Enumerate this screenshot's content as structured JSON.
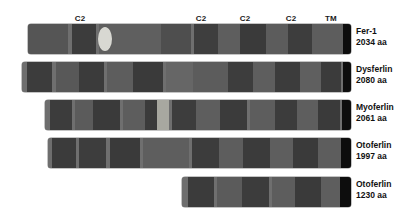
{
  "figure": {
    "type": "protein-domain-diagram",
    "caption_partial": "",
    "background": "#ffffff",
    "annotations": [
      {
        "text": "C2",
        "x": 80,
        "y": 14
      },
      {
        "text": "C2",
        "x": 201,
        "y": 14
      },
      {
        "text": "C2",
        "x": 245,
        "y": 14
      },
      {
        "text": "C2",
        "x": 291,
        "y": 14
      },
      {
        "text": "TM",
        "x": 331,
        "y": 14
      }
    ],
    "colors": {
      "bar_base": "#6f6f6f",
      "domain_dark": "#3f3f3f",
      "domain_mid": "#4e4e4e",
      "domain_light": "#5e5e5e",
      "spacer": "#6e6e6e",
      "spacer_light": "#7b7b7b",
      "tm_black": "#0d0d0d",
      "lens_light": "#d8d8d2",
      "highlight_light": "#a8a8a0",
      "text": "#111111"
    },
    "proteins": [
      {
        "name": "Fer-1",
        "length_label": "2034 aa",
        "row_top": 24,
        "bar_left": 28,
        "bar_right": 351,
        "label_x": 356,
        "label_y": 26,
        "lens": {
          "cx": 105,
          "rx": 7,
          "ry": 12
        },
        "segments": [
          {
            "x": 28,
            "w": 40,
            "color": "#555555"
          },
          {
            "x": 68,
            "w": 4,
            "color": "#6f6f6f"
          },
          {
            "x": 72,
            "w": 24,
            "color": "#3c3c3c"
          },
          {
            "x": 96,
            "w": 3,
            "color": "#6f6f6f"
          },
          {
            "x": 99,
            "w": 62,
            "color": "#5f5f5f"
          },
          {
            "x": 161,
            "w": 30,
            "color": "#4e4e4e"
          },
          {
            "x": 191,
            "w": 3,
            "color": "#6f6f6f"
          },
          {
            "x": 194,
            "w": 24,
            "color": "#3e3e3e"
          },
          {
            "x": 218,
            "w": 22,
            "color": "#5e5e5e"
          },
          {
            "x": 240,
            "w": 26,
            "color": "#3a3a3a"
          },
          {
            "x": 266,
            "w": 22,
            "color": "#5c5c5c"
          },
          {
            "x": 288,
            "w": 24,
            "color": "#3d3d3d"
          },
          {
            "x": 312,
            "w": 31,
            "color": "#5d5d5d"
          },
          {
            "x": 343,
            "w": 8,
            "color": "#0d0d0d"
          }
        ]
      },
      {
        "name": "Dysferlin",
        "length_label": "2080 aa",
        "row_top": 62,
        "bar_left": 22,
        "bar_right": 351,
        "label_x": 356,
        "label_y": 64,
        "lens": null,
        "segments": [
          {
            "x": 22,
            "w": 5,
            "color": "#6e6e6e"
          },
          {
            "x": 27,
            "w": 25,
            "color": "#3c3c3c"
          },
          {
            "x": 52,
            "w": 4,
            "color": "#6f6f6f"
          },
          {
            "x": 56,
            "w": 23,
            "color": "#585858"
          },
          {
            "x": 79,
            "w": 25,
            "color": "#3b3b3b"
          },
          {
            "x": 104,
            "w": 3,
            "color": "#6f6f6f"
          },
          {
            "x": 107,
            "w": 26,
            "color": "#5d5d5d"
          },
          {
            "x": 133,
            "w": 30,
            "color": "#3a3a3a"
          },
          {
            "x": 163,
            "w": 3,
            "color": "#6f6f6f"
          },
          {
            "x": 166,
            "w": 27,
            "color": "#666666"
          },
          {
            "x": 193,
            "w": 35,
            "color": "#5c5c5c"
          },
          {
            "x": 228,
            "w": 25,
            "color": "#3d3d3d"
          },
          {
            "x": 253,
            "w": 22,
            "color": "#5e5e5e"
          },
          {
            "x": 275,
            "w": 25,
            "color": "#3c3c3c"
          },
          {
            "x": 300,
            "w": 21,
            "color": "#5f5f5f"
          },
          {
            "x": 321,
            "w": 20,
            "color": "#3b3b3b"
          },
          {
            "x": 341,
            "w": 2,
            "color": "#6f6f6f"
          },
          {
            "x": 343,
            "w": 8,
            "color": "#0d0d0d"
          }
        ]
      },
      {
        "name": "Myoferlin",
        "length_label": "2061 aa",
        "row_top": 100,
        "bar_left": 45,
        "bar_right": 351,
        "label_x": 356,
        "label_y": 102,
        "lens": null,
        "segments": [
          {
            "x": 45,
            "w": 5,
            "color": "#6e6e6e"
          },
          {
            "x": 50,
            "w": 22,
            "color": "#3c3c3c"
          },
          {
            "x": 72,
            "w": 3,
            "color": "#6f6f6f"
          },
          {
            "x": 75,
            "w": 18,
            "color": "#5b5b5b"
          },
          {
            "x": 93,
            "w": 27,
            "color": "#3a3a3a"
          },
          {
            "x": 120,
            "w": 3,
            "color": "#6f6f6f"
          },
          {
            "x": 123,
            "w": 22,
            "color": "#5d5d5d"
          },
          {
            "x": 145,
            "w": 12,
            "color": "#3b3b3b"
          },
          {
            "x": 157,
            "w": 12,
            "color": "#a8a8a0"
          },
          {
            "x": 169,
            "w": 3,
            "color": "#6f6f6f"
          },
          {
            "x": 172,
            "w": 24,
            "color": "#3d3d3d"
          },
          {
            "x": 196,
            "w": 24,
            "color": "#5e5e5e"
          },
          {
            "x": 220,
            "w": 27,
            "color": "#3b3b3b"
          },
          {
            "x": 247,
            "w": 3,
            "color": "#6f6f6f"
          },
          {
            "x": 250,
            "w": 25,
            "color": "#5d5d5d"
          },
          {
            "x": 275,
            "w": 22,
            "color": "#3c3c3c"
          },
          {
            "x": 297,
            "w": 21,
            "color": "#5e5e5e"
          },
          {
            "x": 318,
            "w": 22,
            "color": "#3a3a3a"
          },
          {
            "x": 340,
            "w": 2,
            "color": "#6f6f6f"
          },
          {
            "x": 342,
            "w": 9,
            "color": "#0d0d0d"
          }
        ]
      },
      {
        "name": "Otoferlin",
        "length_label": "1997 aa",
        "row_top": 138,
        "bar_left": 48,
        "bar_right": 351,
        "label_x": 356,
        "label_y": 140,
        "lens": null,
        "segments": [
          {
            "x": 48,
            "w": 4,
            "color": "#6e6e6e"
          },
          {
            "x": 52,
            "w": 24,
            "color": "#3b3b3b"
          },
          {
            "x": 76,
            "w": 3,
            "color": "#6f6f6f"
          },
          {
            "x": 79,
            "w": 27,
            "color": "#3d3d3d"
          },
          {
            "x": 106,
            "w": 4,
            "color": "#6f6f6f"
          },
          {
            "x": 110,
            "w": 30,
            "color": "#3a3a3a"
          },
          {
            "x": 140,
            "w": 3,
            "color": "#6f6f6f"
          },
          {
            "x": 143,
            "w": 46,
            "color": "#5e5e5e"
          },
          {
            "x": 189,
            "w": 3,
            "color": "#6f6f6f"
          },
          {
            "x": 192,
            "w": 27,
            "color": "#3c3c3c"
          },
          {
            "x": 219,
            "w": 24,
            "color": "#5d5d5d"
          },
          {
            "x": 243,
            "w": 27,
            "color": "#3b3b3b"
          },
          {
            "x": 270,
            "w": 23,
            "color": "#5e5e5e"
          },
          {
            "x": 293,
            "w": 25,
            "color": "#3a3a3a"
          },
          {
            "x": 318,
            "w": 23,
            "color": "#5d5d5d"
          },
          {
            "x": 341,
            "w": 10,
            "color": "#0d0d0d"
          }
        ]
      },
      {
        "name": "Otoferlin",
        "length_label": "1230 aa",
        "row_top": 177,
        "bar_left": 182,
        "bar_right": 351,
        "label_x": 356,
        "label_y": 179,
        "lens": null,
        "segments": [
          {
            "x": 182,
            "w": 6,
            "color": "#6e6e6e"
          },
          {
            "x": 188,
            "w": 26,
            "color": "#3b3b3b"
          },
          {
            "x": 214,
            "w": 3,
            "color": "#6f6f6f"
          },
          {
            "x": 217,
            "w": 25,
            "color": "#5b5b5b"
          },
          {
            "x": 242,
            "w": 27,
            "color": "#3c3c3c"
          },
          {
            "x": 269,
            "w": 3,
            "color": "#6f6f6f"
          },
          {
            "x": 272,
            "w": 23,
            "color": "#5d5d5d"
          },
          {
            "x": 295,
            "w": 26,
            "color": "#3a3a3a"
          },
          {
            "x": 321,
            "w": 19,
            "color": "#5e5e5e"
          },
          {
            "x": 340,
            "w": 11,
            "color": "#0d0d0d"
          }
        ]
      }
    ]
  }
}
